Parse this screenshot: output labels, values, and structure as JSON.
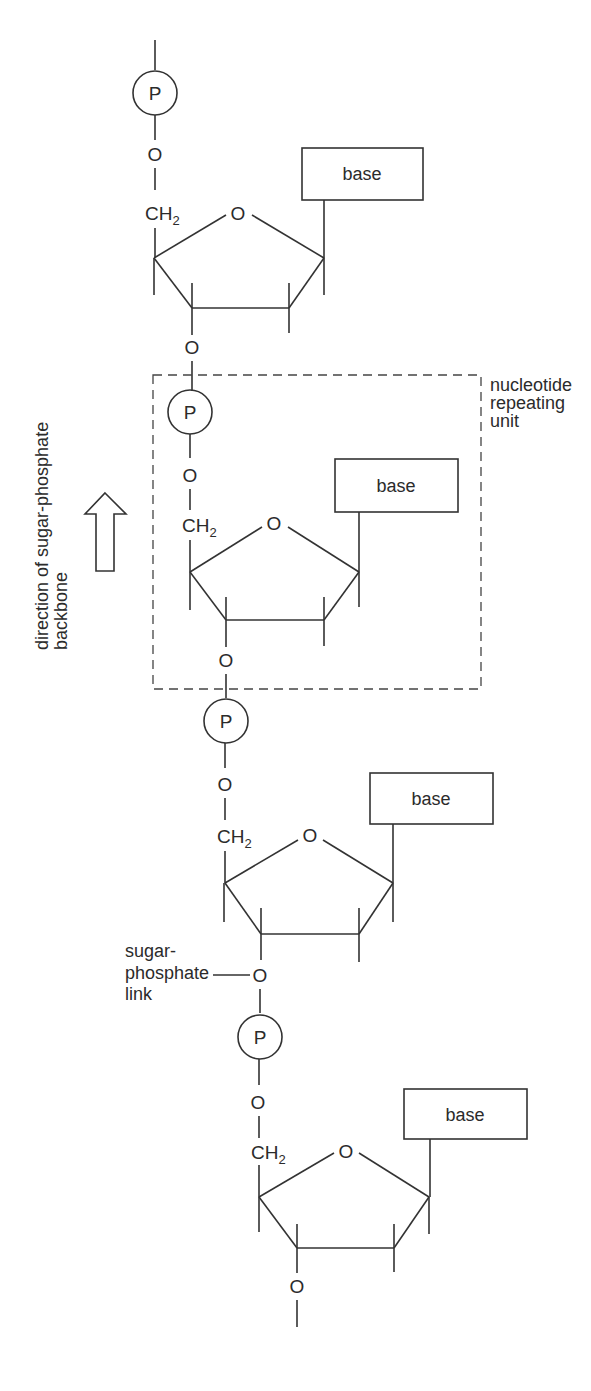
{
  "diagram": {
    "atoms": {
      "phosphate": "P",
      "oxygen": "O",
      "ch2": "CH",
      "ch2_sub": "2"
    },
    "base_label": "base",
    "units": [
      {
        "id": 1,
        "phosphate": "P",
        "base": "base"
      },
      {
        "id": 2,
        "phosphate": "P",
        "base": "base"
      },
      {
        "id": 3,
        "phosphate": "P",
        "base": "base"
      },
      {
        "id": 4,
        "phosphate": "P",
        "base": "base"
      }
    ],
    "labels": {
      "repeating_unit": [
        "nucleotide",
        "repeating",
        "unit"
      ],
      "direction": [
        "direction of sugar-phosphate",
        "backbone"
      ],
      "link": [
        "sugar-",
        "phosphate",
        "link"
      ]
    },
    "colors": {
      "stroke": "#333333",
      "text": "#2b2b2b",
      "background": "#ffffff"
    }
  }
}
